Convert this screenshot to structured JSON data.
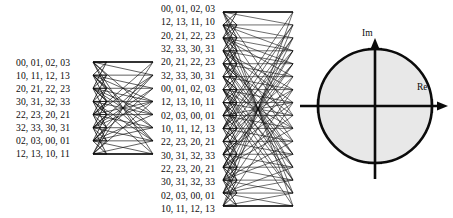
{
  "figure": {
    "type": "fft-butterfly-network-diagram",
    "title": "",
    "background_color": "#ffffff",
    "ink_color": "#0b0b0b"
  },
  "left_stage": {
    "name": "8-point butterfly network",
    "node_count": 8,
    "labels": [
      "00, 01, 02, 03",
      "10, 11, 12, 13",
      "20, 21, 22, 23",
      "30, 31, 32, 33",
      "22, 23, 20, 21",
      "32, 33, 30, 31",
      "02, 03, 00, 01",
      "12, 13, 10, 11"
    ]
  },
  "middle_stage": {
    "name": "16-point butterfly network",
    "node_count": 16,
    "labels": [
      "00, 01, 02, 03",
      "12, 13, 11, 10",
      "20, 21, 22, 23",
      "32, 33, 30, 31",
      "20, 21, 22, 23",
      "32, 33, 30, 31",
      "00, 01, 02, 03",
      "12, 13, 10, 11",
      "02, 03, 00, 01",
      "10, 11, 12, 13",
      "22, 23, 20, 21",
      "30, 31, 32, 33",
      "22, 23, 20, 21",
      "30, 31, 32, 33",
      "02, 03, 00, 01",
      "10, 11, 12, 13"
    ]
  },
  "complex_plane": {
    "name": "unit circle in complex plane",
    "imaginary_axis_label": "Im",
    "real_axis_label": "Re",
    "circle_fill": "#e8e8e8",
    "circle_stroke": "#0b0b0b",
    "center": [
      375,
      106
    ],
    "radius": 57
  }
}
